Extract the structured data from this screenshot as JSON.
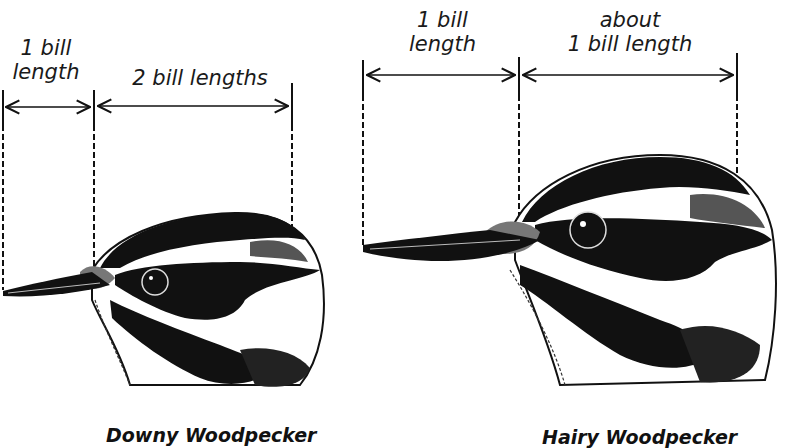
{
  "downy": {
    "label_bill": "1 bill\nlength",
    "label_bill_line1": "1 bill",
    "label_bill_line2": "length",
    "label_head": "2 bill lengths",
    "caption": "Downy Woodpecker"
  },
  "hairy": {
    "label_bill_line1": "1 bill",
    "label_bill_line2": "length",
    "label_head_line1": "about",
    "label_head_line2": "1 bill length",
    "caption": "Hairy Woodpecker"
  },
  "colors": {
    "ink": "#111111",
    "background": "#ffffff"
  }
}
